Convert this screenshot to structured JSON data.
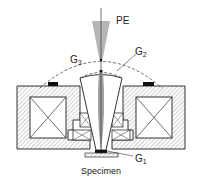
{
  "diagram": {
    "labels": {
      "pe": "PE",
      "g3": "G",
      "g3_sub": "3",
      "g2": "G",
      "g2_sub": "2",
      "g1": "G",
      "g1_sub": "1",
      "specimen": "Specimen"
    },
    "colors": {
      "line": "#333333",
      "beam": "#a8a8a8",
      "hatch": "#888888",
      "pad": "#111111"
    }
  }
}
